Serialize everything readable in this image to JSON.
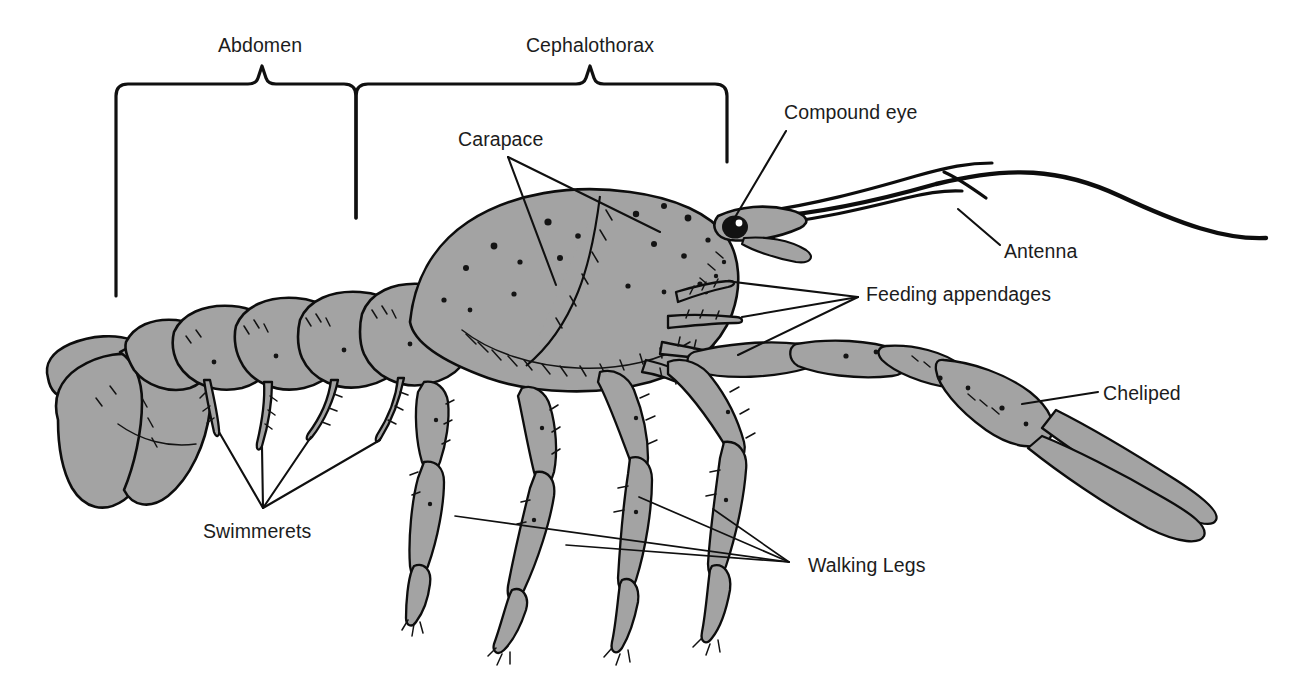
{
  "figure": {
    "view": "lateral",
    "background_color": "#ffffff",
    "body_fill_color": "#a3a3a3",
    "outline_color": "#0d0d0d",
    "text_color": "#1c1c1c"
  },
  "region_braces": [
    {
      "id": "abdomen",
      "label": "Abdomen",
      "label_x": 260,
      "label_y": 45,
      "span_left": 116,
      "span_right": 356,
      "top_y": 84,
      "tip_y": 66,
      "left_drop": 296,
      "right_drop": 218
    },
    {
      "id": "cephalothorax",
      "label": "Cephalothorax",
      "label_x": 590,
      "label_y": 45,
      "span_left": 356,
      "span_right": 727,
      "top_y": 84,
      "tip_y": 66,
      "left_drop": 218,
      "right_drop": 162
    }
  ],
  "labels": [
    {
      "id": "carapace",
      "text": "Carapace",
      "x": 458,
      "y": 146,
      "anchor": "start"
    },
    {
      "id": "compound-eye",
      "text": "Compound eye",
      "x": 784,
      "y": 119,
      "anchor": "start"
    },
    {
      "id": "antenna",
      "text": "Antenna",
      "x": 1004,
      "y": 258,
      "anchor": "start"
    },
    {
      "id": "feeding-appendages",
      "text": "Feeding appendages",
      "x": 866,
      "y": 301,
      "anchor": "start"
    },
    {
      "id": "cheliped",
      "text": "Cheliped",
      "x": 1103,
      "y": 400,
      "anchor": "start"
    },
    {
      "id": "swimmerets",
      "text": "Swimmerets",
      "x": 203,
      "y": 538,
      "anchor": "start"
    },
    {
      "id": "walking-legs",
      "text": "Walking Legs",
      "x": 808,
      "y": 572,
      "anchor": "start"
    }
  ],
  "leader_lines": {
    "carapace": {
      "hub_x": 508,
      "hub_y": 157,
      "targets": [
        [
          556,
          285
        ],
        [
          660,
          232
        ]
      ]
    },
    "compound_eye": {
      "hub_x": 786,
      "hub_y": 131,
      "targets": [
        [
          731,
          224
        ]
      ]
    },
    "antenna": {
      "hub_x": 1000,
      "hub_y": 245,
      "targets": [
        [
          958,
          209
        ]
      ]
    },
    "feeding_appendages": {
      "hub_x": 858,
      "hub_y": 297,
      "targets": [
        [
          726,
          281
        ],
        [
          742,
          317
        ],
        [
          738,
          355
        ]
      ]
    },
    "cheliped": {
      "hub_x": 1098,
      "hub_y": 392,
      "targets": [
        [
          1022,
          404
        ]
      ]
    },
    "swimmerets": {
      "hub_x": 263,
      "hub_y": 508,
      "targets": [
        [
          219,
          432
        ],
        [
          262,
          447
        ],
        [
          311,
          437
        ],
        [
          380,
          440
        ]
      ]
    },
    "walking_legs": {
      "hub_x": 789,
      "hub_y": 562,
      "targets": [
        [
          455,
          516
        ],
        [
          566,
          545
        ],
        [
          639,
          497
        ],
        [
          713,
          509
        ]
      ]
    }
  },
  "anatomy_parts": [
    {
      "name": "telson-and-uropods",
      "label_ref": "abdomen"
    },
    {
      "name": "abdominal-segments",
      "count": 6,
      "label_ref": "abdomen"
    },
    {
      "name": "carapace",
      "label_ref": "carapace"
    },
    {
      "name": "rostrum",
      "label_ref": "cephalothorax"
    },
    {
      "name": "compound-eye",
      "label_ref": "compound-eye"
    },
    {
      "name": "antennae",
      "count": 2,
      "label_ref": "antenna"
    },
    {
      "name": "antennules",
      "count": 2,
      "label_ref": "antenna"
    },
    {
      "name": "feeding-appendages",
      "count": 3,
      "label_ref": "feeding-appendages"
    },
    {
      "name": "cheliped",
      "count": 1,
      "label_ref": "cheliped"
    },
    {
      "name": "swimmerets",
      "count": 4,
      "label_ref": "swimmerets"
    },
    {
      "name": "walking-legs",
      "count": 4,
      "label_ref": "walking-legs"
    }
  ]
}
